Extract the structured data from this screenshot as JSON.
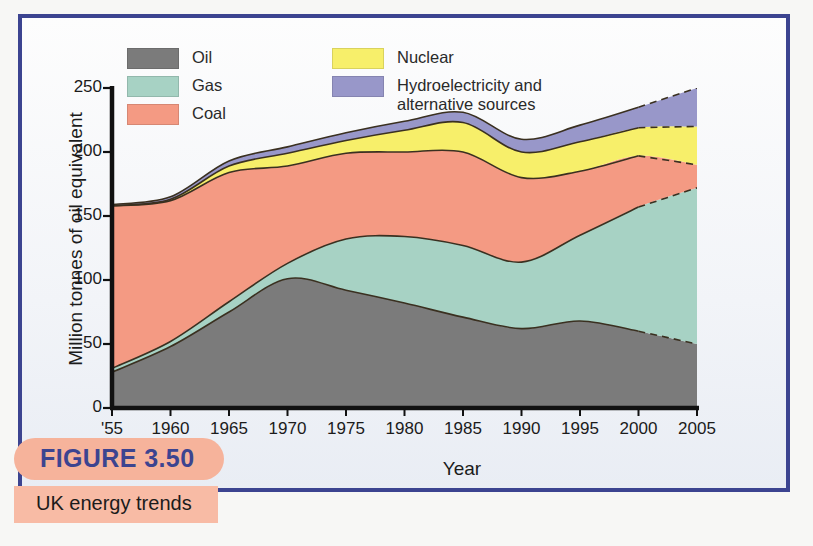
{
  "figure": {
    "caption_number": "FIGURE 3.50",
    "caption_title": "UK energy trends",
    "border_color": "#3c4490",
    "pill_color": "#f6b39b"
  },
  "legend": {
    "items": [
      {
        "label": "Oil",
        "color": "#7b7b7b",
        "icon": "legend-swatch-oil"
      },
      {
        "label": "Gas",
        "color": "#a7d2c4",
        "icon": "legend-swatch-gas"
      },
      {
        "label": "Coal",
        "color": "#f49a83",
        "icon": "legend-swatch-coal"
      },
      {
        "label": "Nuclear",
        "color": "#f7ef6a",
        "icon": "legend-swatch-nuclear"
      },
      {
        "label": "Hydroelectricity and",
        "label2": "alternative sources",
        "color": "#9897c9",
        "icon": "legend-swatch-hydro"
      }
    ]
  },
  "chart_data": {
    "type": "area",
    "stacked": true,
    "title": "UK energy trends",
    "xlabel": "Year",
    "ylabel": "Million tonnes of oil equivalent",
    "xlim": [
      1955,
      2005
    ],
    "ylim": [
      0,
      250
    ],
    "grid": false,
    "legend_position": "top-left",
    "xticks": [
      1955,
      1960,
      1965,
      1970,
      1975,
      1980,
      1985,
      1990,
      1995,
      2000,
      2005
    ],
    "xticklabels": [
      "'55",
      "1960",
      "1965",
      "1970",
      "1975",
      "1980",
      "1985",
      "1990",
      "1995",
      "2000",
      "2005"
    ],
    "yticks": [
      0,
      50,
      100,
      150,
      200,
      250
    ],
    "yticklabels": [
      "0",
      "50",
      "100",
      "150",
      "200",
      "250"
    ],
    "projection_note": "Values after 2000 are shown with dashed boundaries (projected)",
    "projection_start_year": 2000,
    "x": [
      1955,
      1960,
      1965,
      1970,
      1975,
      1980,
      1985,
      1990,
      1995,
      2000,
      2005
    ],
    "series": [
      {
        "name": "Oil",
        "color": "#7b7b7b",
        "values": [
          28,
          48,
          75,
          101,
          92,
          82,
          71,
          62,
          68,
          60,
          50
        ]
      },
      {
        "name": "Gas",
        "color": "#a7d2c4",
        "values": [
          3,
          4,
          8,
          12,
          40,
          52,
          56,
          52,
          67,
          97,
          122
        ]
      },
      {
        "name": "Coal",
        "color": "#f49a83",
        "values": [
          127,
          110,
          101,
          76,
          67,
          66,
          73,
          66,
          50,
          40,
          18
        ]
      },
      {
        "name": "Nuclear",
        "color": "#f7ef6a",
        "values": [
          0,
          1,
          5,
          10,
          10,
          17,
          23,
          20,
          23,
          22,
          30
        ]
      },
      {
        "name": "Hydroelectricity and alternative sources",
        "color": "#9897c9",
        "values": [
          1,
          2,
          4,
          5,
          6,
          7,
          8,
          10,
          13,
          16,
          30
        ]
      }
    ],
    "totals": [
      159,
      165,
      193,
      204,
      215,
      224,
      231,
      210,
      221,
      235,
      250
    ]
  }
}
